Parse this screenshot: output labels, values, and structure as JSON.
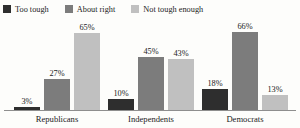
{
  "chart_data": {
    "type": "bar",
    "title": "",
    "subtitle": "",
    "xlabel": "",
    "ylabel": "",
    "ylim": [
      0,
      70
    ],
    "grid": false,
    "legend_position": "top-left",
    "value_suffix": "%",
    "categories": [
      "Republicans",
      "Independents",
      "Democrats"
    ],
    "series": [
      {
        "name": "Too tough",
        "color": "#2e2e2e",
        "values": [
          3,
          10,
          18
        ],
        "labels": [
          "3%",
          "10%",
          "18%"
        ]
      },
      {
        "name": "About right",
        "color": "#7c7c7c",
        "values": [
          27,
          45,
          66
        ],
        "labels": [
          "27%",
          "45%",
          "66%"
        ]
      },
      {
        "name": "Not tough enough",
        "color": "#c0c0c0",
        "values": [
          65,
          43,
          13
        ],
        "labels": [
          "65%",
          "43%",
          "13%"
        ]
      }
    ]
  },
  "legend": {
    "items": [
      {
        "label": "Too tough",
        "swatch": "legend-swatch-too-tough",
        "color": "#2e2e2e"
      },
      {
        "label": "About right",
        "swatch": "legend-swatch-about-right",
        "color": "#7c7c7c"
      },
      {
        "label": "Not tough enough",
        "swatch": "legend-swatch-not-tough-enough",
        "color": "#c0c0c0"
      }
    ]
  },
  "axis": {
    "baseline_color": "#8e8e8e"
  },
  "background": "#fdfdfb"
}
